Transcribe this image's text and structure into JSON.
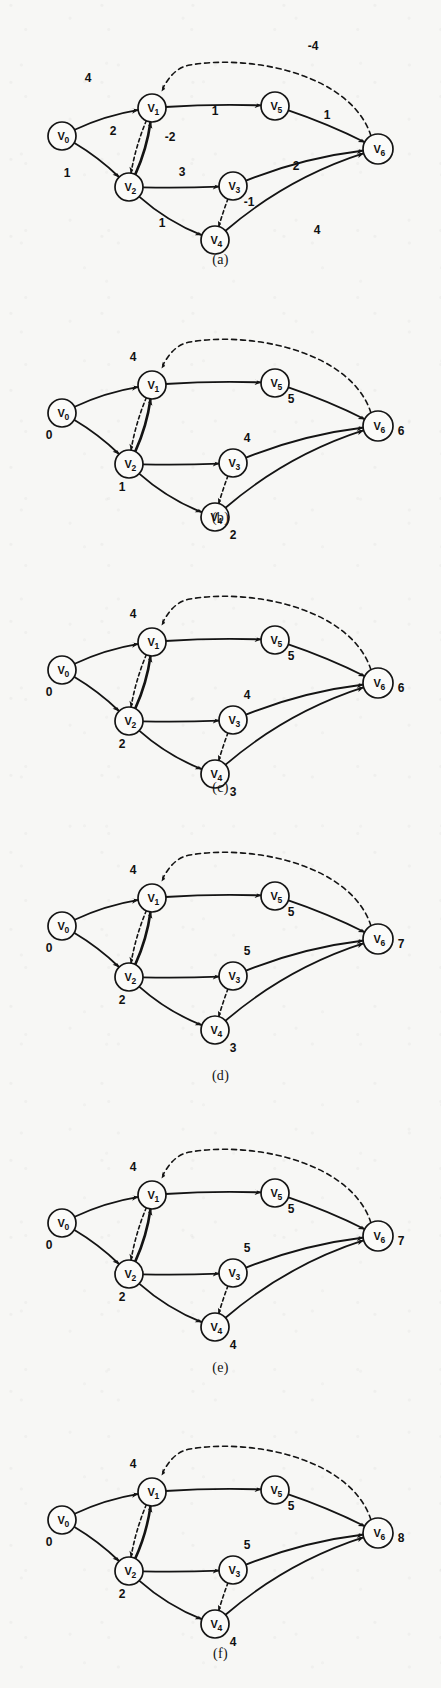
{
  "figure": {
    "node_names": [
      "V0",
      "V1",
      "V2",
      "V3",
      "V4",
      "V5",
      "V6"
    ],
    "node_subscripts": [
      "0",
      "1",
      "2",
      "3",
      "4",
      "5",
      "6"
    ],
    "edge_set": [
      {
        "from": "V0",
        "to": "V1",
        "weight": "4"
      },
      {
        "from": "V0",
        "to": "V2",
        "weight": "1"
      },
      {
        "from": "V2",
        "to": "V1",
        "weight": "2"
      },
      {
        "from": "V1",
        "to": "V2",
        "weight": "-2"
      },
      {
        "from": "V1",
        "to": "V5",
        "weight": "1"
      },
      {
        "from": "V2",
        "to": "V3",
        "weight": "3"
      },
      {
        "from": "V2",
        "to": "V4",
        "weight": "1"
      },
      {
        "from": "V3",
        "to": "V4",
        "weight": "-1"
      },
      {
        "from": "V3",
        "to": "V6",
        "weight": "2"
      },
      {
        "from": "V4",
        "to": "V6",
        "weight": "4"
      },
      {
        "from": "V5",
        "to": "V6",
        "weight": "1"
      },
      {
        "from": "V6",
        "to": "V1",
        "weight": "-4"
      }
    ],
    "panels": [
      {
        "caption": "(a)",
        "shows_weights": true,
        "shows_distances": false,
        "weights": {
          "v0v1": "4",
          "v0v2": "1",
          "v2v1": "2",
          "v1v2": "-2",
          "v1v5": "1",
          "v2v3": "3",
          "v2v4": "1",
          "v3v4": "-1",
          "v3v6": "2",
          "v4v6": "4",
          "v5v6": "1",
          "v6v1": "-4"
        },
        "distances": {}
      },
      {
        "caption": "(b)",
        "shows_weights": false,
        "shows_distances": true,
        "weights": {},
        "distances": {
          "V0": "0",
          "V1": "4",
          "V2": "1",
          "V3": "4",
          "V4": "2",
          "V5": "5",
          "V6": "6"
        }
      },
      {
        "caption": "(c)",
        "shows_weights": false,
        "shows_distances": true,
        "weights": {},
        "distances": {
          "V0": "0",
          "V1": "4",
          "V2": "2",
          "V3": "4",
          "V4": "3",
          "V5": "5",
          "V6": "6"
        }
      },
      {
        "caption": "(d)",
        "shows_weights": false,
        "shows_distances": true,
        "weights": {},
        "distances": {
          "V0": "0",
          "V1": "4",
          "V2": "2",
          "V3": "5",
          "V4": "3",
          "V5": "5",
          "V6": "7"
        }
      },
      {
        "caption": "(e)",
        "shows_weights": false,
        "shows_distances": true,
        "weights": {},
        "distances": {
          "V0": "0",
          "V1": "4",
          "V2": "2",
          "V3": "5",
          "V4": "4",
          "V5": "5",
          "V6": "7"
        }
      },
      {
        "caption": "(f)",
        "shows_weights": false,
        "shows_distances": true,
        "weights": {},
        "distances": {
          "V0": "0",
          "V1": "4",
          "V2": "2",
          "V3": "5",
          "V4": "4",
          "V5": "5",
          "V6": "8"
        }
      }
    ]
  },
  "chart_data": {
    "type": "diagram",
    "nodes": [
      "V0",
      "V1",
      "V2",
      "V3",
      "V4",
      "V5",
      "V6"
    ],
    "edges": [
      {
        "from": "V0",
        "to": "V1",
        "weight": 4,
        "style": "solid"
      },
      {
        "from": "V0",
        "to": "V2",
        "weight": 1,
        "style": "solid"
      },
      {
        "from": "V2",
        "to": "V1",
        "weight": 2,
        "style": "solid"
      },
      {
        "from": "V1",
        "to": "V2",
        "weight": -2,
        "style": "dashed"
      },
      {
        "from": "V1",
        "to": "V5",
        "weight": 1,
        "style": "solid"
      },
      {
        "from": "V2",
        "to": "V3",
        "weight": 3,
        "style": "solid"
      },
      {
        "from": "V2",
        "to": "V4",
        "weight": 1,
        "style": "solid"
      },
      {
        "from": "V3",
        "to": "V4",
        "weight": -1,
        "style": "dashed"
      },
      {
        "from": "V3",
        "to": "V6",
        "weight": 2,
        "style": "solid"
      },
      {
        "from": "V4",
        "to": "V6",
        "weight": 4,
        "style": "solid"
      },
      {
        "from": "V5",
        "to": "V6",
        "weight": 1,
        "style": "solid"
      },
      {
        "from": "V6",
        "to": "V1",
        "weight": -4,
        "style": "dashed"
      }
    ],
    "panel_labels": [
      "(a)",
      "(b)",
      "(c)",
      "(d)",
      "(e)",
      "(f)"
    ],
    "distance_table": {
      "columns": [
        "V0",
        "V1",
        "V2",
        "V3",
        "V4",
        "V5",
        "V6"
      ],
      "rows": [
        {
          "panel": "(b)",
          "values": [
            0,
            4,
            1,
            4,
            2,
            5,
            6
          ]
        },
        {
          "panel": "(c)",
          "values": [
            0,
            4,
            2,
            4,
            3,
            5,
            6
          ]
        },
        {
          "panel": "(d)",
          "values": [
            0,
            4,
            2,
            5,
            3,
            5,
            7
          ]
        },
        {
          "panel": "(e)",
          "values": [
            0,
            4,
            2,
            5,
            4,
            5,
            7
          ]
        },
        {
          "panel": "(f)",
          "values": [
            0,
            4,
            2,
            5,
            4,
            5,
            8
          ]
        }
      ]
    }
  }
}
